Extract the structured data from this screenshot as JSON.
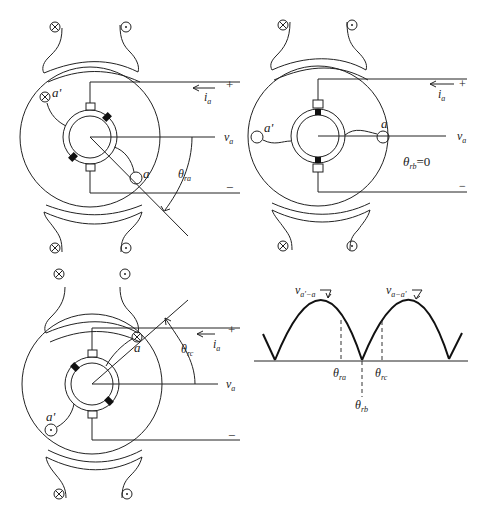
{
  "figure": {
    "panels": [
      {
        "id": "a",
        "description": "Rotor at angle theta_ra (coil side a below horizontal)",
        "labels": {
          "coil_side_a": "a",
          "coil_side_a_prime": "a'",
          "current": "i",
          "current_sub": "a",
          "voltage": "v",
          "voltage_sub": "a",
          "plus": "+",
          "minus": "−",
          "angle": "θ",
          "angle_sub": "ra"
        }
      },
      {
        "id": "b",
        "description": "Rotor at angle theta_rb = 0 (coil horizontal)",
        "labels": {
          "coil_side_a": "a",
          "coil_side_a_prime": "a'",
          "current": "i",
          "current_sub": "a",
          "voltage": "v",
          "voltage_sub": "a",
          "plus": "+",
          "minus": "−",
          "angle": "θ",
          "angle_sub": "rb",
          "angle_value": "=0"
        }
      },
      {
        "id": "c",
        "description": "Rotor at angle theta_rc (coil side a above horizontal)",
        "labels": {
          "coil_side_a": "a",
          "coil_side_a_prime": "a'",
          "current": "i",
          "current_sub": "a",
          "voltage": "v",
          "voltage_sub": "a",
          "plus": "+",
          "minus": "−",
          "angle": "θ",
          "angle_sub": "rc"
        }
      }
    ],
    "waveform": {
      "curve1_label": "v",
      "curve1_sub": "a'−a",
      "curve2_label": "v",
      "curve2_sub": "a−a'",
      "tick_ra": "θ",
      "tick_ra_sub": "ra",
      "tick_rb": "θ",
      "tick_rb_sub": "rb",
      "tick_rc": "θ",
      "tick_rc_sub": "rc"
    },
    "field_symbols": {
      "into_page": "⊗",
      "out_of_page": "⊙"
    }
  }
}
